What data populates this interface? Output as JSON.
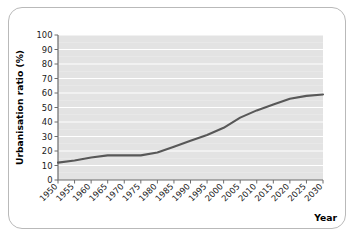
{
  "chart_data": {
    "type": "line",
    "title": "",
    "xlabel": "Year",
    "ylabel": "Urbanisation ratio (%)",
    "xlim": [
      1950,
      2030
    ],
    "ylim": [
      0,
      100
    ],
    "grid": true,
    "legend": false,
    "line_color": "#585858",
    "plot_background": "#e3e3e3",
    "gridline_color": "#ffffff",
    "x_tick_labels": [
      "1950",
      "1955",
      "1960",
      "1965",
      "1970",
      "1975",
      "1980",
      "1985",
      "1990",
      "1995",
      "2000",
      "2005",
      "2010",
      "2015",
      "2020",
      "2025",
      "2030"
    ],
    "y_tick_labels": [
      "0",
      "10",
      "20",
      "30",
      "40",
      "50",
      "60",
      "70",
      "80",
      "90",
      "100"
    ],
    "x": [
      1950,
      1955,
      1960,
      1965,
      1970,
      1975,
      1980,
      1985,
      1990,
      1995,
      2000,
      2005,
      2010,
      2015,
      2020,
      2025,
      2030
    ],
    "values": [
      12,
      13.5,
      15.5,
      17,
      17,
      17,
      19,
      23,
      27,
      31,
      36,
      43,
      48,
      52,
      56,
      58,
      59
    ],
    "series": [
      {
        "name": "Urbanisation ratio",
        "values": [
          12,
          13.5,
          15.5,
          17,
          17,
          17,
          19,
          23,
          27,
          31,
          36,
          43,
          48,
          52,
          56,
          58,
          59
        ]
      }
    ]
  }
}
